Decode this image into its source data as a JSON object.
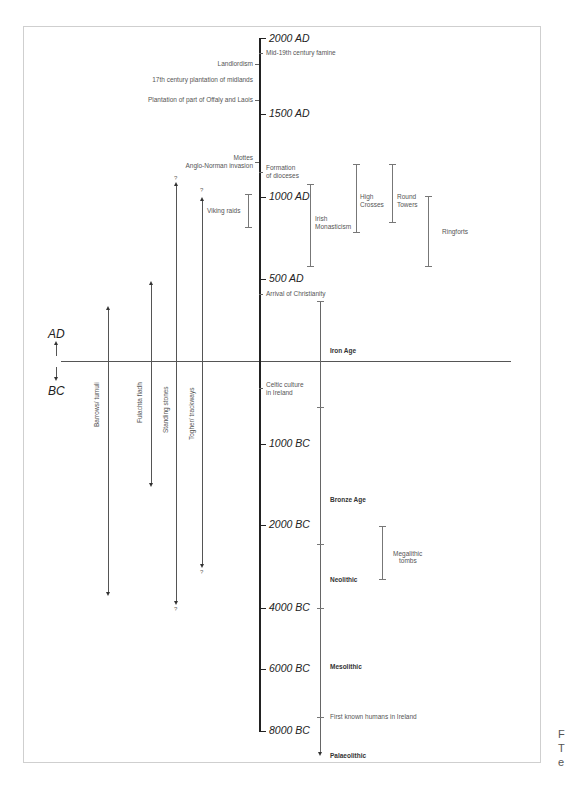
{
  "diagram": {
    "type": "timeline",
    "era_labels": {
      "ad2000": "2000 AD",
      "ad1500": "1500 AD",
      "ad1000": "1000 AD",
      "ad500": "500 AD",
      "bc1000": "1000 BC",
      "bc2000": "2000 BC",
      "bc4000": "4000 BC",
      "bc6000": "6000 BC",
      "bc8000": "8000 BC"
    },
    "direction": {
      "ad": "AD",
      "bc": "BC"
    },
    "left_events": {
      "landlordism": "Landlordism",
      "plantation_midlands": "17th century plantation of midlands",
      "plantation_offaly": "Plantation of part of Offaly and Laois",
      "mottes": "Mottes",
      "anglo_norman": "Anglo-Norman invasion"
    },
    "right_events": {
      "famine": "Mid-19th century famine",
      "dioceses_1": "Formation",
      "dioceses_2": "of dioceses",
      "christianity": "Arrival of Christianity",
      "celtic_1": "Celtic culture",
      "celtic_2": "in Ireland",
      "first_humans": "First known humans in Ireland"
    },
    "periods": {
      "iron_age": "Iron Age",
      "bronze_age": "Bronze Age",
      "neolithic": "Neolithic",
      "mesolithic": "Mesolithic",
      "palaeolithic": "Palaeolithic"
    },
    "ranges": {
      "viking": "Viking raids",
      "monasticism_1": "Irish",
      "monasticism_2": "Monasticism",
      "high_crosses_1": "High",
      "high_crosses_2": "Crosses",
      "round_towers_1": "Round",
      "round_towers_2": "Towers",
      "ringforts": "Ringforts",
      "megalithic_1": "Megalithic",
      "megalithic_2": "tombs"
    },
    "monuments": {
      "barrows": "Barrows/ tumuli",
      "fulachta": "Fulachta fiadh",
      "standing_stones": "Standing stones",
      "togher": "Togher/ trackways",
      "uncertain": "?"
    },
    "side_fragment": [
      "F",
      "T",
      "e"
    ]
  }
}
